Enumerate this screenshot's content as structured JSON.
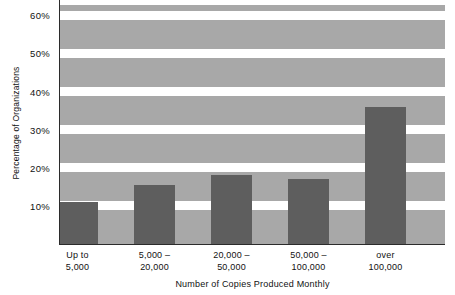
{
  "chart_data": {
    "type": "bar",
    "title": "",
    "subtitle": "",
    "xlabel": "Number of Copies Produced Monthly",
    "ylabel": "Percentage of Organizations",
    "categories": [
      "Up to\n5,000",
      "5,000 –\n20,000",
      "20,000 –\n50,000",
      "50,000 –\n100,000",
      "over\n100,000"
    ],
    "category_lines": [
      [
        "Up to",
        "5,000"
      ],
      [
        "5,000 –",
        "20,000"
      ],
      [
        "20,000 –",
        "50,000"
      ],
      [
        "50,000 –",
        "100,000"
      ],
      [
        "over",
        "100,000"
      ]
    ],
    "values": [
      11,
      15.5,
      18,
      17,
      36
    ],
    "ylim": [
      0,
      64
    ],
    "ytick_values": [
      10,
      20,
      30,
      40,
      50,
      60
    ],
    "ytick_labels": [
      "10%",
      "20%",
      "30%",
      "40%",
      "50%",
      "60%"
    ],
    "grid": "horizontal-bands",
    "legend": "none",
    "colors": {
      "bar": "#5e5e5e",
      "band": "#a8a8a8",
      "background": "#ffffff",
      "axis": "#2b2b2b",
      "text": "#111111"
    }
  }
}
